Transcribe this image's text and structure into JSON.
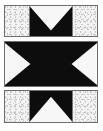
{
  "figure": {
    "caption": "",
    "canvas": {
      "width": 103,
      "height": 131
    },
    "background_color": "#fefefe",
    "ink_color": "#0d0d0d",
    "paper_color": "#f3f3f3",
    "border_color": "#6e6e6e"
  },
  "panels": [
    {
      "id": "panel-top",
      "name": "top-panel",
      "label": "Top panel",
      "shape": "downward-triangle-notch",
      "description": "Speckled light background with a centered black rectangle containing a white downward-pointing triangle forming a V",
      "fill": "#0d0d0d",
      "cutout": "#f7f7f7",
      "x": 4,
      "y": 5,
      "width": 94,
      "height": 32
    },
    {
      "id": "panel-middle",
      "name": "middle-panel",
      "label": "Middle panel",
      "shape": "bowtie-hourglass",
      "description": "Solid black field with white triangles intruding from the left and right edges, leaving a black bowtie",
      "fill": "#0d0d0d",
      "cutout": "#f7f7f7",
      "x": 4,
      "y": 41,
      "width": 94,
      "height": 46
    },
    {
      "id": "panel-bottom",
      "name": "bottom-panel",
      "label": "Bottom panel",
      "shape": "upward-triangle-notch",
      "description": "Speckled light background with a centered black rectangle containing a white upward-pointing triangle",
      "fill": "#0d0d0d",
      "cutout": "#f7f7f7",
      "x": 4,
      "y": 90,
      "width": 94,
      "height": 33
    }
  ]
}
